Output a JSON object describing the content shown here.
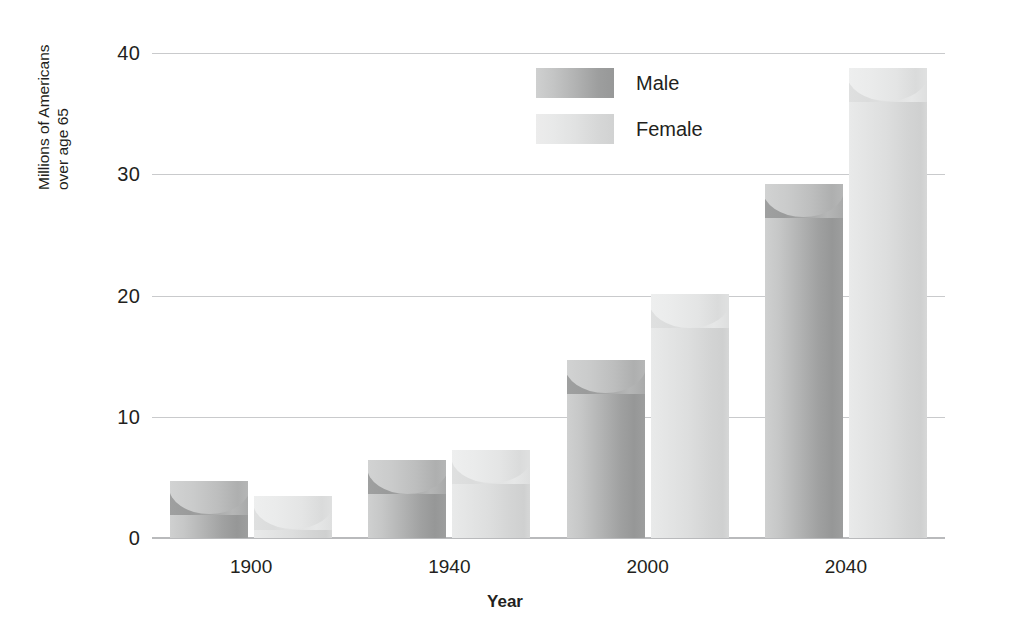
{
  "chart_data": {
    "type": "bar",
    "title": "",
    "subtitle": "",
    "xlabel": "Year",
    "ylabel": "Millions of Americans over age 65",
    "ylabel_line1": "Millions of Americans",
    "ylabel_line2": "over age 65",
    "categories": [
      "1900",
      "1940",
      "2000",
      "2040"
    ],
    "series": [
      {
        "name": "Male",
        "values": [
          4.7,
          6.4,
          14.7,
          29.2
        ],
        "color": "#a9aaaa"
      },
      {
        "name": "Female",
        "values": [
          3.5,
          7.3,
          20.1,
          38.8
        ],
        "color": "#dedfdf"
      }
    ],
    "ylim": [
      0,
      40
    ],
    "yticks": [
      0,
      10,
      20,
      30,
      40
    ],
    "ytick_labels": [
      "0",
      "10",
      "20",
      "30",
      "40"
    ],
    "grid": true,
    "grid_axis": "y",
    "legend_position": "top-center",
    "bar_style": "3d-cylinder",
    "background": "#ffffff",
    "grid_color": "#c9cacc",
    "text_color": "#231f20"
  },
  "legend": {
    "entries": [
      {
        "label": "Male"
      },
      {
        "label": "Female"
      }
    ]
  },
  "axes": {
    "y_title_line1": "Millions of Americans",
    "y_title_line2": "over age 65",
    "x_title": "Year"
  }
}
